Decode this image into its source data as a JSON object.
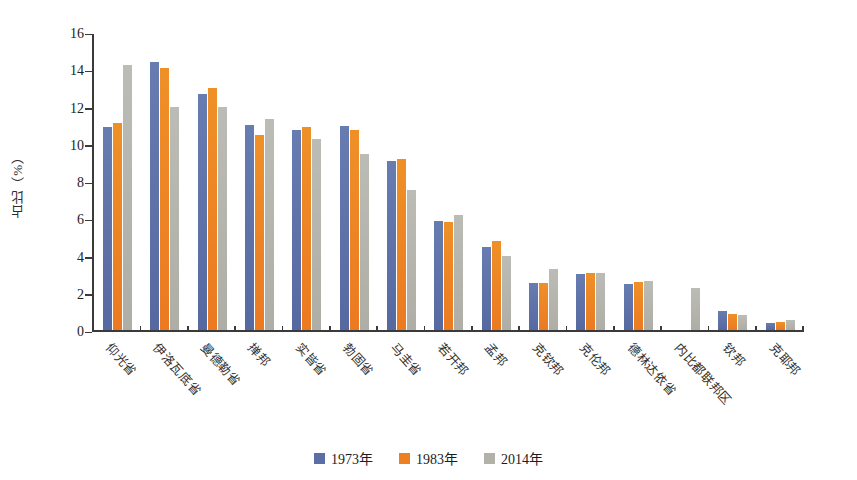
{
  "chart_data": {
    "type": "bar",
    "title": "",
    "xlabel": "",
    "ylabel": "占比（%）",
    "ylim": [
      0,
      16
    ],
    "ytick_step": 2,
    "yticks": [
      0,
      2,
      4,
      6,
      8,
      10,
      12,
      14,
      16
    ],
    "grid": false,
    "legend_position": "bottom",
    "categories": [
      "仰光省",
      "伊洛瓦底省",
      "曼德勒省",
      "掸邦",
      "实皆省",
      "勃固省",
      "马圭省",
      "若开邦",
      "孟邦",
      "克钦邦",
      "克伦邦",
      "德林达依省",
      "内比都联邦区",
      "钦邦",
      "克耶邦"
    ],
    "series": [
      {
        "name": "1973年",
        "color": "#5b6ea5",
        "values": [
          10.9,
          14.4,
          12.65,
          11.0,
          10.75,
          10.95,
          9.05,
          5.85,
          4.45,
          2.55,
          3.0,
          2.45,
          null,
          1.0,
          0.35
        ]
      },
      {
        "name": "1983年",
        "color": "#ec8023",
        "values": [
          11.1,
          14.05,
          13.0,
          10.45,
          10.9,
          10.75,
          9.2,
          5.8,
          4.8,
          2.55,
          3.05,
          2.6,
          null,
          0.85,
          0.45
        ]
      },
      {
        "name": "2014年",
        "color": "#b2b2ab",
        "values": [
          14.25,
          11.95,
          11.95,
          11.35,
          10.25,
          9.45,
          7.5,
          6.2,
          3.95,
          3.25,
          3.05,
          2.65,
          2.25,
          0.8,
          0.55
        ]
      }
    ]
  }
}
